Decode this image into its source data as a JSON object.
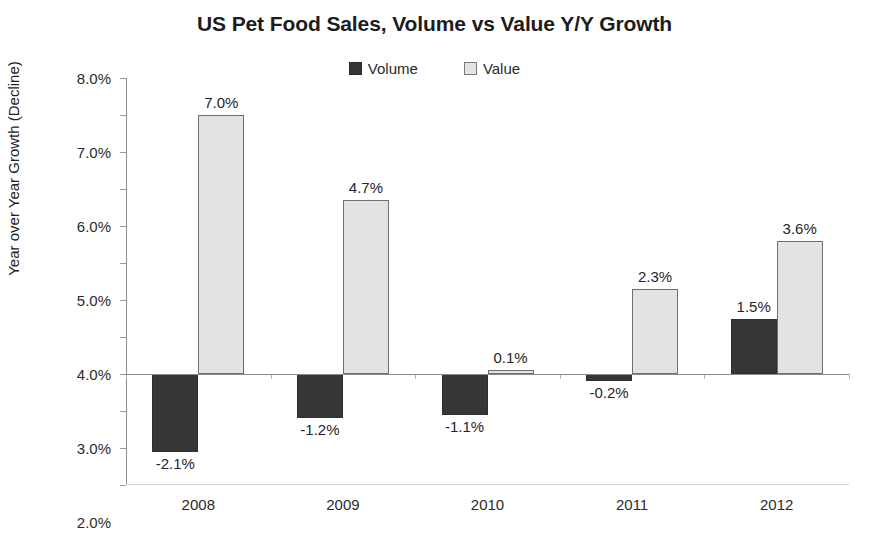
{
  "chart_data": {
    "type": "bar",
    "title": "US Pet Food Sales, Volume vs Value Y/Y Growth",
    "xlabel": "",
    "ylabel": "Year over Year Growth (Decline)",
    "categories": [
      "2008",
      "2009",
      "2010",
      "2011",
      "2012"
    ],
    "series": [
      {
        "name": "Volume",
        "color": "#363636",
        "values": [
          -2.1,
          -1.2,
          -1.1,
          -0.2,
          1.5
        ],
        "labels": [
          "-2.1%",
          "-1.2%",
          "-1.1%",
          "-0.2%",
          "1.5%"
        ]
      },
      {
        "name": "Value",
        "color": "#e3e3e3",
        "values": [
          7.0,
          4.7,
          0.1,
          2.3,
          3.6
        ],
        "labels": [
          "7.0%",
          "4.7%",
          "0.1%",
          "2.3%",
          "3.6%"
        ]
      }
    ],
    "ylim": [
      -3.0,
      8.0
    ],
    "ytick_values": [
      8.0,
      7.0,
      6.0,
      5.0,
      4.0,
      3.0,
      2.0,
      1.0,
      0.0,
      -1.0,
      -2.0,
      -3.0
    ],
    "ytick_labels": [
      "8.0%",
      "7.0%",
      "6.0%",
      "5.0%",
      "4.0%",
      "3.0%",
      "2.0%",
      "1.0%",
      "0.0%",
      "-1.0%",
      "-2.0%",
      "-3.0%"
    ],
    "grid": false,
    "legend_position": "top-center",
    "units": "percent"
  },
  "legend": {
    "items": [
      {
        "label": "Volume",
        "swatch": "filled-dark-square"
      },
      {
        "label": "Value",
        "swatch": "outlined-light-square"
      }
    ]
  }
}
